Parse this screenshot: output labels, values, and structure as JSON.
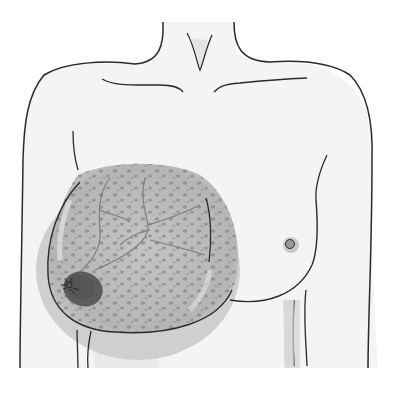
{
  "illustration": {
    "subject": "Female torso front view with enlarged right breast showing dotted skin texture (peau d'orange), veins and a dark nipple region",
    "colors": {
      "background": "#ffffff",
      "skin": "#f3f3f3",
      "outline": "#2a2a2a",
      "affected_area": "#b9b9b9",
      "spots": "#8e8e8e",
      "veins": "#7a7a7a",
      "nipple_affected": "#5c5c5c",
      "nipple_normal": "#9a9a9a",
      "shadow": "#d4d4d4"
    }
  }
}
